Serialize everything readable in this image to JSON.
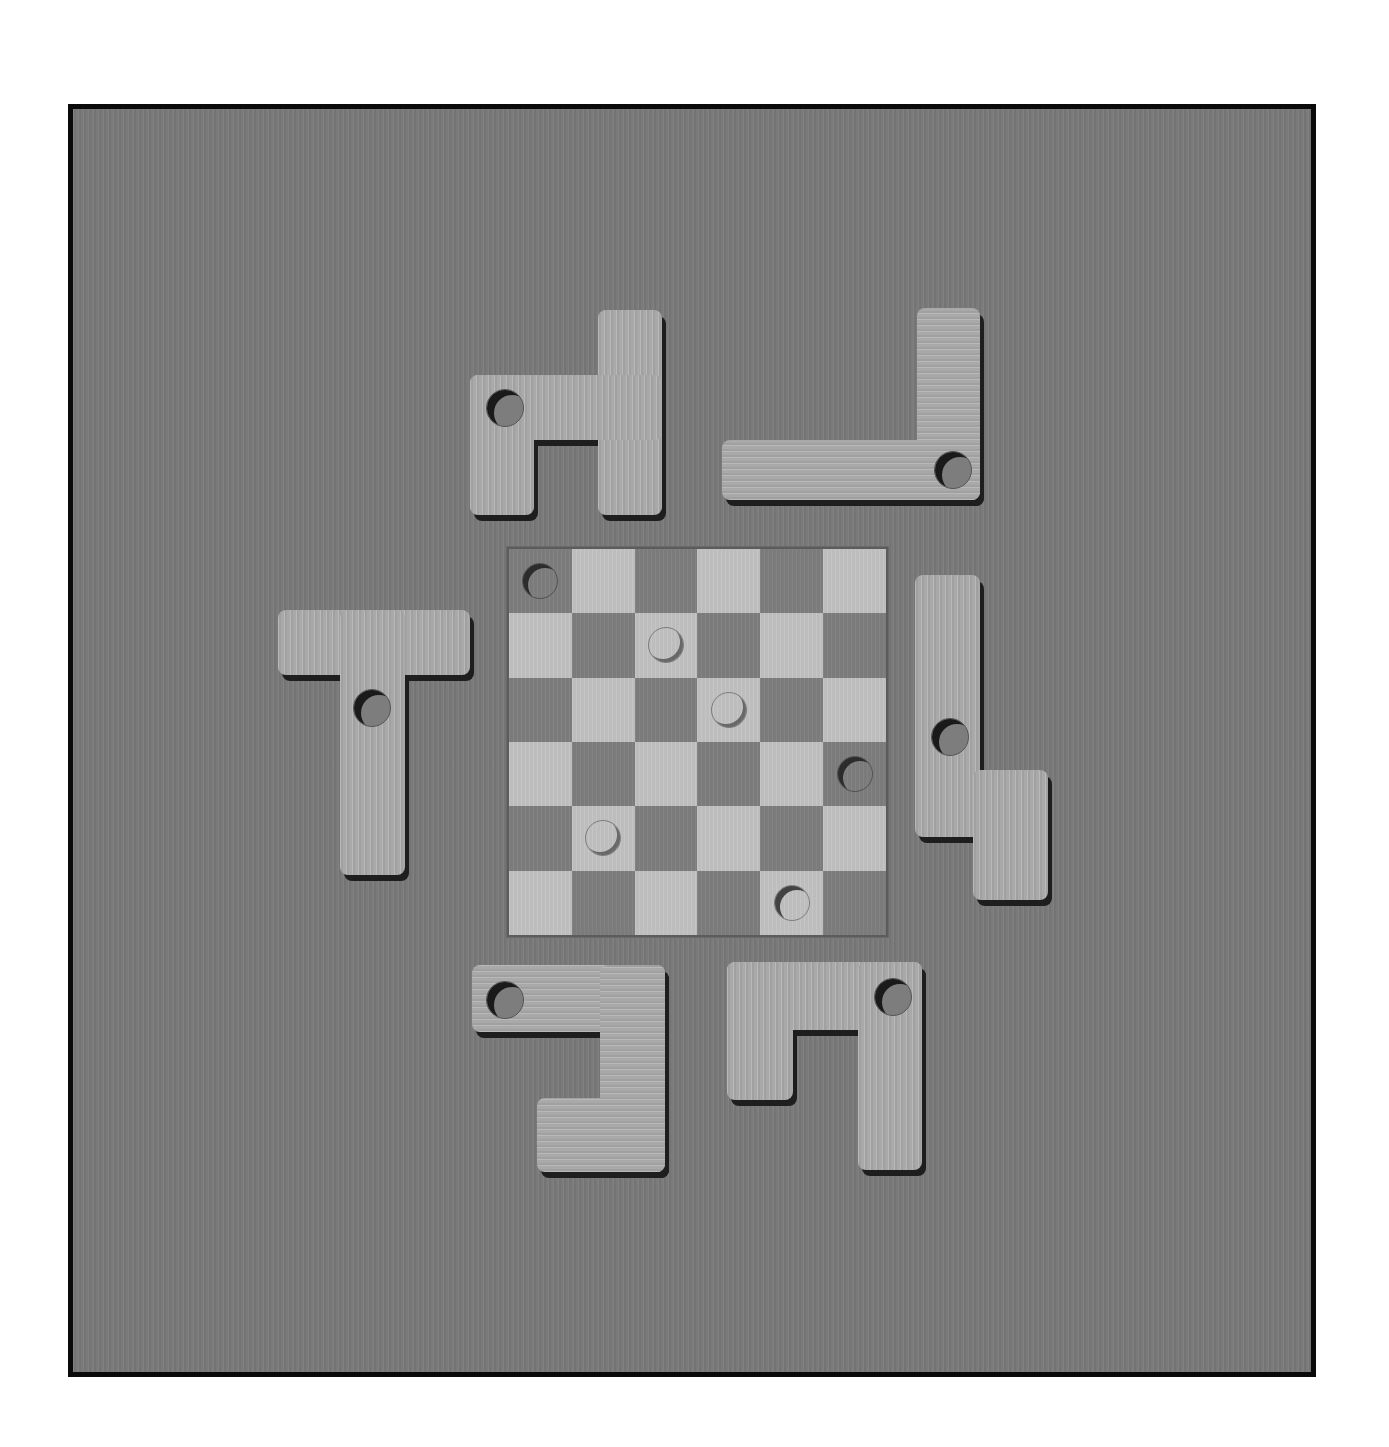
{
  "scene": {
    "title": "",
    "background_color": "#ffffff",
    "frame_color": "#7a7a7a",
    "frame_border_color": "#0a0a0a"
  },
  "board": {
    "rows": 6,
    "cols": 6,
    "x": 507,
    "y": 547,
    "width": 377,
    "height": 386,
    "light_color": "#bdbdbd",
    "dark_color": "#7b7b7b",
    "top_left_is_dark": true,
    "pegs": [
      {
        "row": 0,
        "col": 0,
        "type": "hole"
      },
      {
        "row": 1,
        "col": 2,
        "type": "raised"
      },
      {
        "row": 2,
        "col": 3,
        "type": "raised"
      },
      {
        "row": 3,
        "col": 5,
        "type": "hole"
      },
      {
        "row": 4,
        "col": 1,
        "type": "raised"
      },
      {
        "row": 5,
        "col": 4,
        "type": "hole"
      }
    ]
  },
  "pieces": [
    {
      "name": "piece-top-left",
      "grain": "vertical",
      "parts": [
        [
          598,
          310,
          64,
          205
        ],
        [
          470,
          375,
          192,
          65
        ],
        [
          470,
          375,
          64,
          140
        ]
      ],
      "hole": [
        505,
        408
      ]
    },
    {
      "name": "piece-top-right",
      "grain": "horizontal",
      "parts": [
        [
          917,
          308,
          63,
          192
        ],
        [
          722,
          440,
          258,
          60
        ]
      ],
      "hole": [
        953,
        470
      ]
    },
    {
      "name": "piece-left-t",
      "grain": "vertical",
      "parts": [
        [
          278,
          610,
          192,
          65
        ],
        [
          340,
          610,
          65,
          265
        ]
      ],
      "hole": [
        372,
        708
      ]
    },
    {
      "name": "piece-right-s",
      "grain": "vertical",
      "parts": [
        [
          915,
          575,
          65,
          262
        ],
        [
          973,
          770,
          75,
          130
        ]
      ],
      "hole": [
        950,
        737
      ]
    },
    {
      "name": "piece-bottom-left",
      "grain": "horizontal",
      "parts": [
        [
          472,
          965,
          193,
          67
        ],
        [
          600,
          965,
          65,
          207
        ],
        [
          537,
          1098,
          128,
          74
        ]
      ],
      "hole": [
        505,
        1000
      ]
    },
    {
      "name": "piece-bottom-right",
      "grain": "vertical",
      "parts": [
        [
          727,
          962,
          195,
          68
        ],
        [
          727,
          962,
          66,
          138
        ],
        [
          858,
          962,
          64,
          208
        ]
      ],
      "hole": [
        893,
        997
      ]
    }
  ]
}
